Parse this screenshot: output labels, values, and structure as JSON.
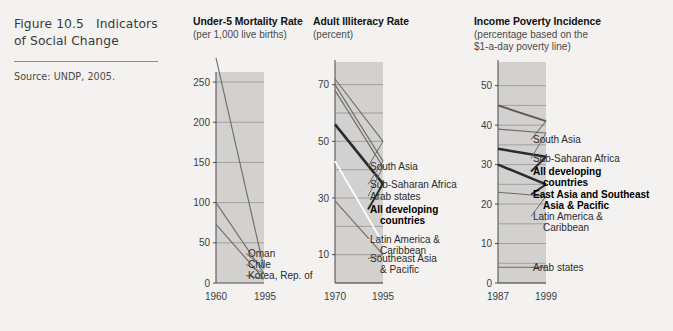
{
  "caption": {
    "figure_number": "Figure 10.5",
    "figure_title": "Indicators",
    "figure_title_line2": "of Social Change",
    "source": "Source: UNDP, 2005."
  },
  "colors": {
    "page_background": "#f3f2f0",
    "plot_band": "#d2d1cf",
    "axis": "#4a4a4a",
    "gridline": "#8d8b88",
    "line_default": "#6e6c6a",
    "line_bold": "#2b2b2b",
    "line_white": "#ffffff",
    "text": "#2b2b2b",
    "rule": "#8e8c89"
  },
  "chart_data": [
    {
      "type": "line",
      "title": "Under-5 Mortality Rate",
      "subtitle": "(per 1,000 live births)",
      "xlabel": "",
      "ylabel": "",
      "x": [
        1960,
        1995
      ],
      "tick_labels_x": [
        "1960",
        "1995"
      ],
      "ylim": [
        0,
        260
      ],
      "yticks": [
        0,
        50,
        100,
        150,
        200,
        250
      ],
      "tick_labels_y": [
        "0",
        "50",
        "100",
        "150",
        "200",
        "250"
      ],
      "gridlines": [
        50,
        100,
        150,
        200,
        250
      ],
      "grid": true,
      "legend_position": "right-inline",
      "series": [
        {
          "name": "Oman",
          "values": [
            280,
            18
          ],
          "style": "plain",
          "color": "#6e6c6a"
        },
        {
          "name": "Chile",
          "values": [
            100,
            12
          ],
          "style": "plain",
          "color": "#6e6c6a"
        },
        {
          "name": "Korea, Rep. of",
          "values": [
            73,
            5
          ],
          "style": "plain",
          "color": "#6e6c6a"
        }
      ]
    },
    {
      "type": "line",
      "title": "Adult Illiteracy Rate",
      "subtitle": "(percent)",
      "xlabel": "",
      "ylabel": "",
      "x": [
        1970,
        1995
      ],
      "tick_labels_x": [
        "1970",
        "1995"
      ],
      "ylim": [
        0,
        78
      ],
      "yticks": [
        10,
        30,
        50,
        70
      ],
      "tick_labels_y": [
        "10",
        "30",
        "50",
        "70"
      ],
      "gridlines": [
        0,
        10,
        20,
        30,
        40,
        50,
        60,
        70
      ],
      "grid": true,
      "legend_position": "right-inline",
      "series": [
        {
          "name": "South Asia",
          "values": [
            72,
            50
          ],
          "style": "plain",
          "color": "#6e6c6a"
        },
        {
          "name": "Sub-Saharan Africa",
          "values": [
            70,
            43
          ],
          "style": "plain",
          "color": "#6e6c6a"
        },
        {
          "name": "Arab states",
          "values": [
            68,
            41
          ],
          "style": "plain",
          "color": "#6e6c6a"
        },
        {
          "name": "All developing countries",
          "values": [
            56,
            35
          ],
          "style": "bold",
          "color": "#2b2b2b"
        },
        {
          "name": "Latin America & Caribbean",
          "values": [
            43,
            14
          ],
          "style": "white",
          "color": "#ffffff"
        },
        {
          "name": "Southeast Asia & Pacific",
          "values": [
            29,
            10
          ],
          "style": "plain",
          "color": "#6e6c6a"
        }
      ]
    },
    {
      "type": "line",
      "title": "Income Poverty Incidence",
      "subtitle": "(percentage based on the",
      "subtitle_line2": "$1-a-day poverty line)",
      "xlabel": "",
      "ylabel": "",
      "x": [
        1987,
        1999
      ],
      "tick_labels_x": [
        "1987",
        "1999"
      ],
      "ylim": [
        0,
        56
      ],
      "yticks": [
        0,
        10,
        20,
        30,
        40,
        50
      ],
      "tick_labels_y": [
        "0",
        "10",
        "20",
        "30",
        "40",
        "50"
      ],
      "gridlines": [
        0,
        5,
        10,
        15,
        20,
        25,
        30,
        35,
        40,
        45,
        50
      ],
      "grid": true,
      "legend_position": "right-inline",
      "series": [
        {
          "name": "South Asia",
          "values": [
            45,
            41
          ],
          "style": "semibold",
          "color": "#5a5856"
        },
        {
          "name": "Sub-Saharan Africa",
          "values": [
            39,
            38
          ],
          "style": "plain",
          "color": "#6e6c6a"
        },
        {
          "name": "All developing countries",
          "values": [
            34,
            32
          ],
          "style": "bold",
          "color": "#2b2b2b"
        },
        {
          "name": "East Asia and Southeast Asia & Pacific",
          "values": [
            30,
            25
          ],
          "style": "bold",
          "color": "#2b2b2b"
        },
        {
          "name": "Latin America & Caribbean",
          "values": [
            23,
            22
          ],
          "style": "plain",
          "color": "#6e6c6a"
        },
        {
          "name": "Arab states",
          "values": [
            4,
            4
          ],
          "style": "plain",
          "color": "#6e6c6a"
        }
      ]
    }
  ]
}
